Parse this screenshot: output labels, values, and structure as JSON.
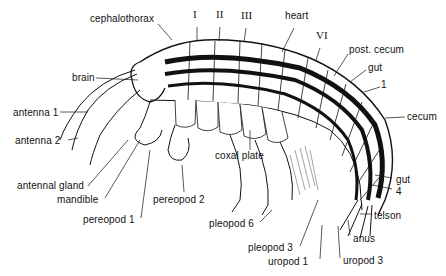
{
  "diagram": {
    "colors": {
      "ink": "#111111",
      "background": "#ffffff",
      "shade": "#777777"
    },
    "labels": [
      {
        "id": "cephalothorax",
        "text": "cephalothorax",
        "x": 90,
        "y": 19,
        "roman": false
      },
      {
        "id": "seg-I",
        "text": "I",
        "x": 193,
        "y": 15,
        "roman": true
      },
      {
        "id": "seg-II",
        "text": "II",
        "x": 216,
        "y": 15,
        "roman": true
      },
      {
        "id": "seg-III",
        "text": "III",
        "x": 241,
        "y": 16,
        "roman": true
      },
      {
        "id": "heart",
        "text": "heart",
        "x": 285,
        "y": 16,
        "roman": false
      },
      {
        "id": "seg-VI",
        "text": "VI",
        "x": 316,
        "y": 36,
        "roman": true
      },
      {
        "id": "post-cecum",
        "text": "post. cecum",
        "x": 349,
        "y": 48,
        "roman": false
      },
      {
        "id": "gut-upper",
        "text": "gut",
        "x": 368,
        "y": 66,
        "roman": false
      },
      {
        "id": "num-1",
        "text": "1",
        "x": 381,
        "y": 83,
        "roman": false
      },
      {
        "id": "cecum",
        "text": "cecum",
        "x": 407,
        "y": 113,
        "roman": false
      },
      {
        "id": "brain",
        "text": "brain",
        "x": 72,
        "y": 74,
        "roman": false
      },
      {
        "id": "antenna-1",
        "text": "antenna 1",
        "x": 13,
        "y": 108,
        "roman": false
      },
      {
        "id": "antenna-2",
        "text": "antenna 2",
        "x": 15,
        "y": 136,
        "roman": false
      },
      {
        "id": "coxal-plate",
        "text": "coxal plate",
        "x": 215,
        "y": 152,
        "roman": false
      },
      {
        "id": "antennal-gland",
        "text": "antennal gland",
        "x": 17,
        "y": 182,
        "roman": false
      },
      {
        "id": "mandible",
        "text": "mandible",
        "x": 57,
        "y": 195,
        "roman": false
      },
      {
        "id": "pereopod-2",
        "text": "pereopod 2",
        "x": 153,
        "y": 195,
        "roman": false
      },
      {
        "id": "pereopod-1",
        "text": "pereopod 1",
        "x": 83,
        "y": 215,
        "roman": false
      },
      {
        "id": "pleopod-6",
        "text": "pleopod 6",
        "x": 209,
        "y": 219,
        "roman": false
      },
      {
        "id": "gut-lower",
        "text": "gut",
        "x": 396,
        "y": 174,
        "roman": false
      },
      {
        "id": "num-4",
        "text": "4",
        "x": 396,
        "y": 186,
        "roman": false
      },
      {
        "id": "telson",
        "text": "telson",
        "x": 374,
        "y": 210,
        "roman": false
      },
      {
        "id": "anus",
        "text": "anus",
        "x": 353,
        "y": 232,
        "roman": false
      },
      {
        "id": "pleopod-3",
        "text": "pleopod 3",
        "x": 248,
        "y": 241,
        "roman": false
      },
      {
        "id": "uropod-1",
        "text": "uropod 1",
        "x": 268,
        "y": 255,
        "roman": false
      },
      {
        "id": "uropod-3",
        "text": "uropod 3",
        "x": 343,
        "y": 254,
        "roman": false
      }
    ]
  }
}
